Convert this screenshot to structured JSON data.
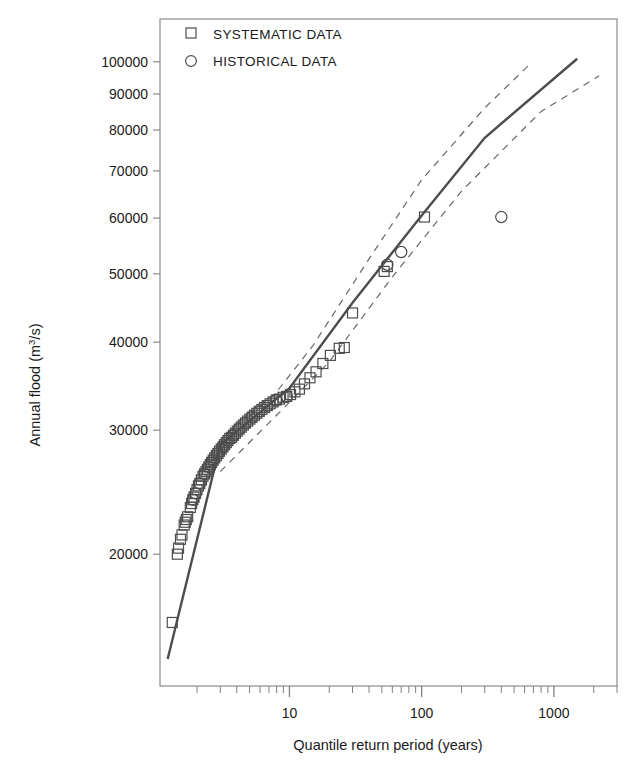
{
  "chart_data": {
    "type": "scatter",
    "title": "",
    "subtitle": "",
    "xlabel": "Quantile return period (years)",
    "ylabel": "Annual flood (m3/s)",
    "ylabel_base": "Annual flood (m",
    "ylabel_sup": "3",
    "ylabel_tail": "/s)",
    "xscale": "log",
    "yscale": "log",
    "xlim": [
      1.05,
      3000
    ],
    "ylim": [
      13000,
      115000
    ],
    "grid": false,
    "legend_position": "top-left-inside",
    "xticks": [
      10,
      100,
      1000
    ],
    "xtick_labels": [
      "10",
      "100",
      "1000"
    ],
    "xminor_ticks": [
      2,
      3,
      4,
      5,
      6,
      7,
      8,
      9,
      20,
      30,
      40,
      50,
      60,
      70,
      80,
      90,
      200,
      300,
      400,
      500,
      600,
      700,
      800,
      900,
      2000,
      3000
    ],
    "yticks": [
      20000,
      30000,
      40000,
      50000,
      60000,
      70000,
      80000,
      90000,
      100000
    ],
    "ytick_labels": [
      "20000",
      "30000",
      "40000",
      "50000",
      "60000",
      "70000",
      "80000",
      "90000",
      "100000"
    ],
    "legend": [
      {
        "label": "SYSTEMATIC DATA",
        "marker": "square"
      },
      {
        "label": "HISTORICAL DATA",
        "marker": "circle"
      }
    ],
    "colors": {
      "marker_stroke": "#4d4d4d",
      "fit_line": "#4d4d4d",
      "confidence_band": "#666666",
      "axis": "#808080",
      "text": "#1a1a1a"
    },
    "series": [
      {
        "name": "SYSTEMATIC DATA",
        "marker": "square",
        "points": [
          [
            1.3,
            16000
          ],
          [
            1.42,
            20000
          ],
          [
            1.45,
            20400
          ],
          [
            1.5,
            21000
          ],
          [
            1.54,
            21300
          ],
          [
            1.6,
            22000
          ],
          [
            1.63,
            22200
          ],
          [
            1.66,
            22400
          ],
          [
            1.7,
            22600
          ],
          [
            1.78,
            23300
          ],
          [
            1.82,
            23600
          ],
          [
            1.86,
            23900
          ],
          [
            1.9,
            24100
          ],
          [
            1.95,
            24400
          ],
          [
            2.0,
            24700
          ],
          [
            2.05,
            25000
          ],
          [
            2.1,
            25200
          ],
          [
            2.16,
            25500
          ],
          [
            2.22,
            25800
          ],
          [
            2.28,
            26000
          ],
          [
            2.34,
            26200
          ],
          [
            2.4,
            26400
          ],
          [
            2.46,
            26600
          ],
          [
            2.52,
            26800
          ],
          [
            2.58,
            27000
          ],
          [
            2.65,
            27200
          ],
          [
            2.72,
            27400
          ],
          [
            2.8,
            27600
          ],
          [
            2.88,
            27800
          ],
          [
            2.96,
            28000
          ],
          [
            3.05,
            28200
          ],
          [
            3.14,
            28400
          ],
          [
            3.23,
            28600
          ],
          [
            3.33,
            28800
          ],
          [
            3.43,
            29000
          ],
          [
            3.54,
            29200
          ],
          [
            3.65,
            29300
          ],
          [
            3.77,
            29500
          ],
          [
            3.9,
            29700
          ],
          [
            4.03,
            29900
          ],
          [
            4.17,
            30100
          ],
          [
            4.32,
            30300
          ],
          [
            4.48,
            30500
          ],
          [
            4.65,
            30700
          ],
          [
            4.83,
            30900
          ],
          [
            5.02,
            31100
          ],
          [
            5.22,
            31300
          ],
          [
            5.44,
            31500
          ],
          [
            5.67,
            31700
          ],
          [
            5.92,
            31900
          ],
          [
            6.19,
            32100
          ],
          [
            6.48,
            32300
          ],
          [
            6.8,
            32500
          ],
          [
            7.15,
            32700
          ],
          [
            7.53,
            32900
          ],
          [
            7.95,
            33100
          ],
          [
            8.42,
            33200
          ],
          [
            8.95,
            33400
          ],
          [
            9.55,
            33500
          ],
          [
            10.2,
            33700
          ],
          [
            11.0,
            34000
          ],
          [
            11.9,
            34300
          ],
          [
            13.0,
            34900
          ],
          [
            14.3,
            35600
          ],
          [
            15.9,
            36300
          ],
          [
            17.9,
            37300
          ],
          [
            20.4,
            38300
          ],
          [
            23.8,
            39200
          ],
          [
            26.0,
            39300
          ],
          [
            30.0,
            44000
          ],
          [
            52.0,
            50400
          ],
          [
            55.0,
            51200
          ],
          [
            105.0,
            60200
          ]
        ]
      },
      {
        "name": "HISTORICAL DATA",
        "marker": "circle",
        "points": [
          [
            1.86,
            23900
          ],
          [
            1.95,
            24400
          ],
          [
            2.1,
            25200
          ],
          [
            2.28,
            26000
          ],
          [
            2.46,
            26600
          ],
          [
            2.65,
            27200
          ],
          [
            2.88,
            27800
          ],
          [
            3.14,
            28400
          ],
          [
            3.43,
            29000
          ],
          [
            3.77,
            29500
          ],
          [
            4.17,
            30100
          ],
          [
            4.65,
            30700
          ],
          [
            5.22,
            31300
          ],
          [
            5.92,
            31900
          ],
          [
            6.8,
            32500
          ],
          [
            7.95,
            33100
          ],
          [
            9.55,
            33500
          ],
          [
            55.0,
            51500
          ],
          [
            70.0,
            53700
          ],
          [
            400.0,
            60200
          ]
        ]
      }
    ],
    "fit_line": {
      "name": "fitted quantile curve",
      "style": "solid",
      "points": [
        [
          1.2,
          14200
        ],
        [
          3.0,
          28600
        ],
        [
          10.0,
          34400
        ],
        [
          30.0,
          45500
        ],
        [
          100.0,
          60500
        ],
        [
          300.0,
          78000
        ],
        [
          1500.0,
          101000
        ]
      ]
    },
    "confidence_bands": [
      {
        "name": "upper confidence limit",
        "style": "dashed",
        "points": [
          [
            5.0,
            31400
          ],
          [
            8.0,
            34000
          ],
          [
            15.0,
            39500
          ],
          [
            40.0,
            52500
          ],
          [
            100.0,
            68000
          ],
          [
            300.0,
            86000
          ],
          [
            650.0,
            99000
          ]
        ]
      },
      {
        "name": "lower confidence limit",
        "style": "dashed",
        "points": [
          [
            3.0,
            26200
          ],
          [
            8.0,
            31500
          ],
          [
            20.0,
            37500
          ],
          [
            60.0,
            49500
          ],
          [
            200.0,
            65500
          ],
          [
            800.0,
            85000
          ],
          [
            2200.0,
            95500
          ]
        ]
      }
    ]
  }
}
